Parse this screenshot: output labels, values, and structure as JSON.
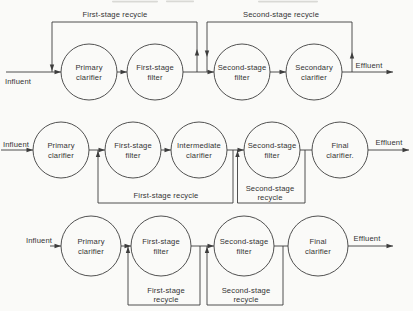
{
  "figure": {
    "type": "process-flow-diagram",
    "colors": {
      "background": "#fafaf8",
      "line": "#3d3d3d",
      "text": "#333333"
    }
  },
  "diagrams": [
    {
      "id": "two-stage-filtration-with-secondary-clarifier",
      "influent": "Influent",
      "effluent": "Effluent",
      "recycles": [
        {
          "label": "First-stage recycle"
        },
        {
          "label": "Second-stage recycle"
        }
      ],
      "units": [
        {
          "line1": "Primary",
          "line2": "clarifier"
        },
        {
          "line1": "First-stage",
          "line2": "filter"
        },
        {
          "line1": "Second-stage",
          "line2": "filter"
        },
        {
          "line1": "Secondary",
          "line2": "clarifier"
        }
      ]
    },
    {
      "id": "two-stage-filtration-with-intermediate-clarifier",
      "influent": "Influent",
      "effluent": "Effluent",
      "recycles": [
        {
          "label": "First-stage recycle"
        },
        {
          "line1": "Second-stage",
          "line2": "recycle"
        }
      ],
      "units": [
        {
          "line1": "Primary",
          "line2": "clarifier"
        },
        {
          "line1": "First-stage",
          "line2": "filter"
        },
        {
          "line1": "Intermediate",
          "line2": "clarifier"
        },
        {
          "line1": "Second-stage",
          "line2": "filter"
        },
        {
          "line1": "Final",
          "line2": "clarifier."
        }
      ]
    },
    {
      "id": "two-stage-filtration-direct",
      "influent": "Influent",
      "effluent": "Effluent",
      "recycles": [
        {
          "line1": "First-stage",
          "line2": "recycle"
        },
        {
          "line1": "Second-stage",
          "line2": "recycle"
        }
      ],
      "units": [
        {
          "line1": "Primary",
          "line2": "clarifier"
        },
        {
          "line1": "First-stage",
          "line2": "filter"
        },
        {
          "line1": "Second-stage",
          "line2": "filter"
        },
        {
          "line1": "Final",
          "line2": "clarifier"
        }
      ]
    }
  ]
}
